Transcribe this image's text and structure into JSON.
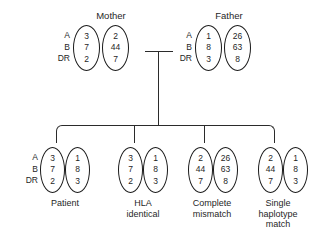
{
  "figure": {
    "type": "hla-haplotype-pedigree",
    "locus_labels": "A\nB\nDR",
    "locus_list": [
      "A",
      "B",
      "DR"
    ]
  },
  "parents": [
    {
      "title": "Mother",
      "haplotypes": [
        {
          "name": "maternal-haplotype-a",
          "alleles": [
            "3",
            "7",
            "2"
          ]
        },
        {
          "name": "maternal-haplotype-b",
          "alleles": [
            "2",
            "44",
            "7"
          ]
        }
      ]
    },
    {
      "title": "Father",
      "haplotypes": [
        {
          "name": "paternal-haplotype-c",
          "alleles": [
            "1",
            "8",
            "3"
          ]
        },
        {
          "name": "paternal-haplotype-d",
          "alleles": [
            "26",
            "63",
            "8"
          ]
        }
      ]
    }
  ],
  "children": [
    {
      "caption": "Patient",
      "caption_lines": [
        "Patient"
      ],
      "show_locus_labels": true,
      "haplotypes": [
        {
          "name": "patient-haplotype-a",
          "alleles": [
            "3",
            "7",
            "2"
          ]
        },
        {
          "name": "patient-haplotype-c",
          "alleles": [
            "1",
            "8",
            "3"
          ]
        }
      ]
    },
    {
      "caption": "HLA identical",
      "caption_lines": [
        "HLA",
        "identical"
      ],
      "show_locus_labels": false,
      "haplotypes": [
        {
          "name": "sibling1-haplotype-a",
          "alleles": [
            "3",
            "7",
            "2"
          ]
        },
        {
          "name": "sibling1-haplotype-c",
          "alleles": [
            "1",
            "8",
            "3"
          ]
        }
      ]
    },
    {
      "caption": "Complete mismatch",
      "caption_lines": [
        "Complete",
        "mismatch"
      ],
      "show_locus_labels": false,
      "haplotypes": [
        {
          "name": "sibling2-haplotype-b",
          "alleles": [
            "2",
            "44",
            "7"
          ]
        },
        {
          "name": "sibling2-haplotype-d",
          "alleles": [
            "26",
            "63",
            "8"
          ]
        }
      ]
    },
    {
      "caption": "Single haplotype match",
      "caption_lines": [
        "Single",
        "haplotype",
        "match"
      ],
      "show_locus_labels": false,
      "haplotypes": [
        {
          "name": "sibling3-haplotype-b",
          "alleles": [
            "2",
            "44",
            "7"
          ]
        },
        {
          "name": "sibling3-haplotype-c",
          "alleles": [
            "1",
            "8",
            "3"
          ]
        }
      ]
    }
  ],
  "colors": {
    "background": "#ffffff",
    "ink": "#1f1f1f",
    "line": "#2b2b2b"
  }
}
